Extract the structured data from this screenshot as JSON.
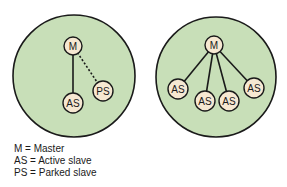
{
  "colors": {
    "piconet_fill": "#c8dfb8",
    "node_fill": "#f6e8d2",
    "stroke": "#1a1a1a"
  },
  "diagrams": [
    {
      "name": "piconet-left",
      "nodes": [
        {
          "id": "m",
          "label": "M",
          "role": "master"
        },
        {
          "id": "as1",
          "label": "AS",
          "role": "active-slave"
        },
        {
          "id": "ps1",
          "label": "PS",
          "role": "parked-slave"
        }
      ],
      "links": [
        {
          "from": "m",
          "to": "as1",
          "style": "solid"
        },
        {
          "from": "m",
          "to": "ps1",
          "style": "dotted"
        }
      ]
    },
    {
      "name": "piconet-right",
      "nodes": [
        {
          "id": "m",
          "label": "M",
          "role": "master"
        },
        {
          "id": "as1",
          "label": "AS",
          "role": "active-slave"
        },
        {
          "id": "as2",
          "label": "AS",
          "role": "active-slave"
        },
        {
          "id": "as3",
          "label": "AS",
          "role": "active-slave"
        },
        {
          "id": "as4",
          "label": "AS",
          "role": "active-slave"
        }
      ],
      "links": [
        {
          "from": "m",
          "to": "as1",
          "style": "solid"
        },
        {
          "from": "m",
          "to": "as2",
          "style": "solid"
        },
        {
          "from": "m",
          "to": "as3",
          "style": "solid"
        },
        {
          "from": "m",
          "to": "as4",
          "style": "solid"
        }
      ]
    }
  ],
  "legend": [
    "M = Master",
    "AS = Active slave",
    "PS = Parked slave"
  ]
}
